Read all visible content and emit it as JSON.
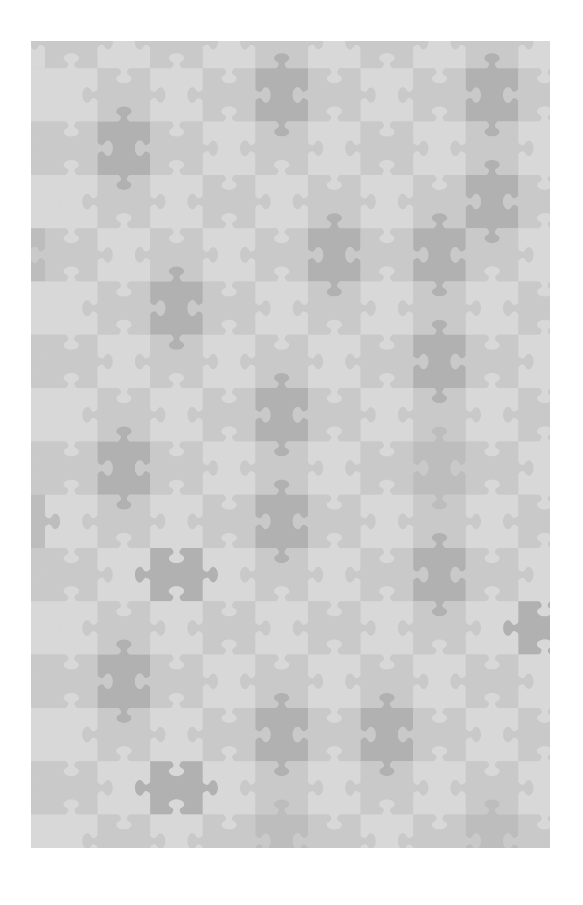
{
  "image": {
    "description": "Gray jigsaw puzzle tessellation pattern",
    "frame": {
      "x": 31,
      "y": 41,
      "width": 519,
      "height": 807
    },
    "background": "#ffffff"
  },
  "grid": {
    "origin_x": -38.6,
    "origin_y": -26,
    "cell_width": 52.6,
    "cell_height": 53.3,
    "columns": 11,
    "rows": 16,
    "orientation_rule": "cells where (col+row) is even have tabs left/right; odd have tabs top/bottom"
  },
  "palette": {
    "0": "#d8d8d8",
    "1": "#c9c9c9",
    "2": "#bdbdbd",
    "3": "#b1b1b1"
  },
  "shades": [
    [
      0,
      1,
      0,
      1,
      0,
      1,
      0,
      1,
      0,
      1,
      0
    ],
    [
      0,
      0,
      1,
      0,
      1,
      3,
      1,
      0,
      1,
      3,
      1
    ],
    [
      1,
      1,
      3,
      1,
      0,
      1,
      0,
      1,
      0,
      1,
      0
    ],
    [
      0,
      0,
      1,
      0,
      1,
      0,
      1,
      0,
      1,
      3,
      1
    ],
    [
      2,
      1,
      0,
      1,
      0,
      1,
      3,
      1,
      3,
      1,
      0
    ],
    [
      0,
      0,
      1,
      3,
      1,
      0,
      1,
      0,
      1,
      0,
      1
    ],
    [
      1,
      1,
      0,
      1,
      0,
      1,
      0,
      1,
      3,
      1,
      0
    ],
    [
      0,
      0,
      1,
      0,
      1,
      3,
      1,
      0,
      1,
      0,
      1
    ],
    [
      1,
      1,
      3,
      1,
      0,
      1,
      0,
      1,
      2,
      1,
      0
    ],
    [
      2,
      0,
      1,
      0,
      1,
      3,
      1,
      0,
      1,
      0,
      1
    ],
    [
      1,
      1,
      0,
      3,
      0,
      1,
      0,
      1,
      3,
      1,
      0
    ],
    [
      0,
      0,
      1,
      0,
      1,
      0,
      1,
      0,
      1,
      0,
      3
    ],
    [
      1,
      1,
      3,
      1,
      0,
      1,
      0,
      1,
      0,
      1,
      0
    ],
    [
      0,
      0,
      1,
      0,
      1,
      3,
      1,
      3,
      1,
      0,
      1
    ],
    [
      1,
      1,
      0,
      3,
      0,
      1,
      0,
      1,
      0,
      1,
      0
    ],
    [
      0,
      0,
      1,
      0,
      1,
      2,
      1,
      0,
      1,
      2,
      1
    ]
  ]
}
